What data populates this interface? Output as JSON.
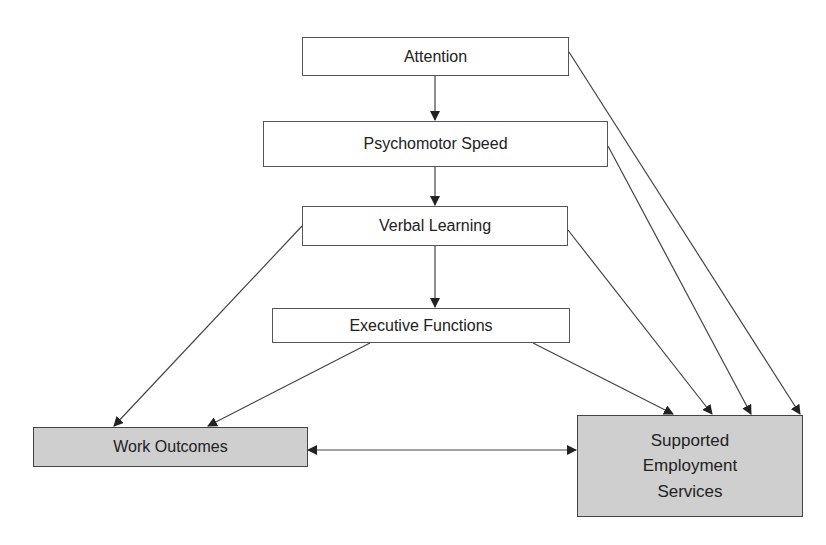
{
  "diagram": {
    "type": "flow",
    "nodes": [
      {
        "id": "attention",
        "label": "Attention",
        "fill": "#ffffff"
      },
      {
        "id": "psychomotor",
        "label": "Psychomotor Speed",
        "fill": "#ffffff"
      },
      {
        "id": "verbal",
        "label": "Verbal Learning",
        "fill": "#ffffff"
      },
      {
        "id": "executive",
        "label": "Executive Functions",
        "fill": "#ffffff"
      },
      {
        "id": "work",
        "label": "Work Outcomes",
        "fill": "#cfcfcf"
      },
      {
        "id": "ses",
        "label": "Supported\nEmployment\nServices",
        "fill": "#cfcfcf"
      }
    ],
    "edges": [
      {
        "from": "attention",
        "to": "psychomotor",
        "direction": "forward"
      },
      {
        "from": "psychomotor",
        "to": "verbal",
        "direction": "forward"
      },
      {
        "from": "verbal",
        "to": "executive",
        "direction": "forward"
      },
      {
        "from": "attention",
        "to": "ses",
        "direction": "forward"
      },
      {
        "from": "psychomotor",
        "to": "ses",
        "direction": "forward"
      },
      {
        "from": "verbal",
        "to": "ses",
        "direction": "forward"
      },
      {
        "from": "executive",
        "to": "ses",
        "direction": "forward"
      },
      {
        "from": "verbal",
        "to": "work",
        "direction": "forward"
      },
      {
        "from": "executive",
        "to": "work",
        "direction": "forward"
      },
      {
        "from": "work",
        "to": "ses",
        "direction": "bidirectional"
      }
    ]
  }
}
